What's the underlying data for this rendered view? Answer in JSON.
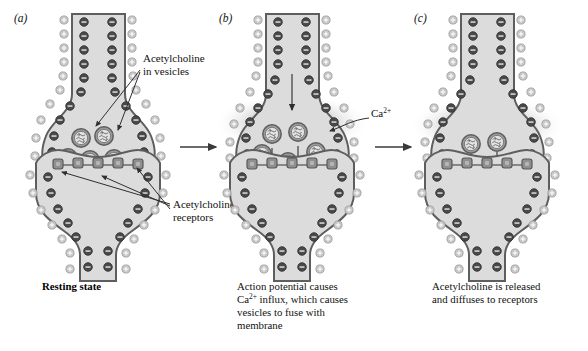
{
  "figure": {
    "panels": [
      {
        "letter": "(a)",
        "caption": "Resting state",
        "caption_style": "bold",
        "callouts": [
          {
            "line1": "Acetylcholine",
            "line2": "in vesicles"
          },
          {
            "line1": "Acetylcholine",
            "line2": "receptors"
          }
        ]
      },
      {
        "letter": "(b)",
        "caption_lines": [
          "Action potential causes",
          "Ca2+ influx, which causes",
          "vesicles to fuse with",
          "membrane"
        ],
        "caption_line2_pre": "Ca",
        "caption_line2_sup": "2+",
        "caption_line2_post": " influx, which causes",
        "callouts": [
          {
            "base": "Ca",
            "sup": "2+"
          }
        ]
      },
      {
        "letter": "(c)",
        "caption_lines": [
          "Acetylcholine is released",
          "and diffuses to receptors"
        ]
      }
    ],
    "ion_symbols": {
      "negative": "–",
      "positive": "+"
    },
    "colors": {
      "cytoplasm": "#d9d9d9",
      "membrane_line": "#595959",
      "negative_ion": "#4a4a4a",
      "positive_ion": "#bdbdbd",
      "receptor": "#8c8c8c",
      "vesicle": "#9a9a9a",
      "halo": "#c8c8c8",
      "arrow": "#3a3a3a",
      "background": "#ffffff"
    }
  }
}
